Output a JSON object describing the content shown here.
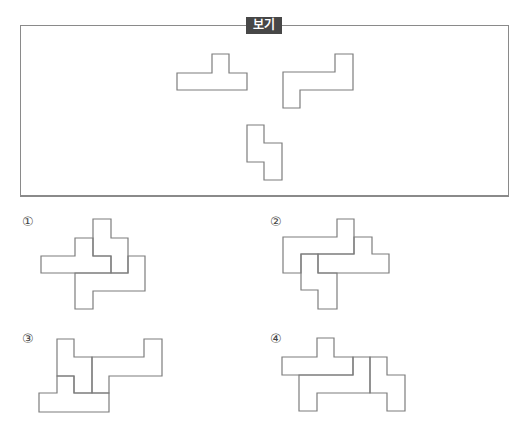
{
  "question": {
    "box_label": "보기",
    "given_pieces": [
      {
        "name": "t-piece",
        "points": "177,73 177,90 247,90 247,73 229,73 229,54 212,54 212,73"
      },
      {
        "name": "z-piece",
        "points": "283,72 283,108 300,108 300,90 353,90 353,54 335,54 335,72"
      },
      {
        "name": "s-piece",
        "points": "247,125 247,162 264,162 264,180 282,180 282,143 264,143 264,125"
      }
    ]
  },
  "options": [
    {
      "label": "①",
      "x": 22,
      "y": 214
    },
    {
      "label": "②",
      "x": 270,
      "y": 214
    },
    {
      "label": "③",
      "x": 22,
      "y": 331
    },
    {
      "label": "④",
      "x": 270,
      "y": 331
    }
  ]
}
